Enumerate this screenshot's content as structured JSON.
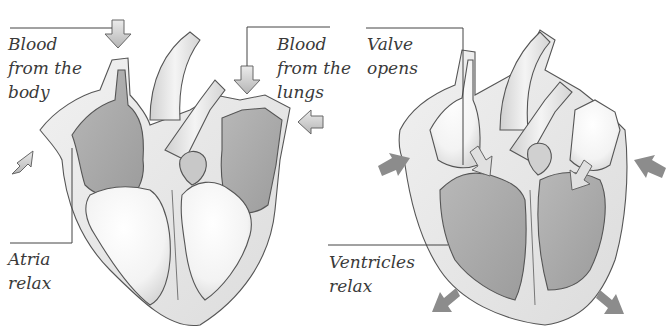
{
  "diagram": {
    "panels": [
      {
        "id": "left",
        "state": "atria-relax",
        "labels": {
          "blood_from_body": [
            "Blood",
            "from the",
            "body"
          ],
          "blood_from_lungs": [
            "Blood",
            "from the",
            "lungs"
          ],
          "atria_relax": [
            "Atria",
            "relax"
          ]
        }
      },
      {
        "id": "right",
        "state": "ventricles-relax",
        "labels": {
          "valve_opens": [
            "Valve",
            "opens"
          ],
          "ventricles_relax": [
            "Ventricles",
            "relax"
          ]
        }
      }
    ],
    "colors": {
      "background": "#ffffff",
      "outline": "#555555",
      "wall": "#e6e6e6",
      "chamber_dark": "#a9a9a9",
      "chamber_light": "#f6f6f6",
      "vessel": "#ededed",
      "arrow_light": "#cfcfcf",
      "arrow_dark": "#8c8c8c",
      "leader_line": "#444444",
      "text": "#3a3a3a"
    },
    "icons": {
      "flow_arrow": "arrow-icon",
      "contraction_arrow": "arrow-icon"
    }
  }
}
